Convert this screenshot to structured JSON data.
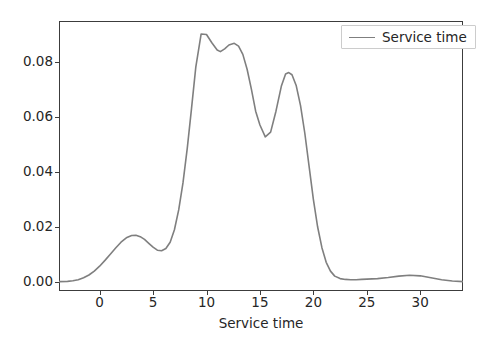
{
  "chart_data": {
    "type": "line",
    "title": "",
    "subtitle": "",
    "xlabel": "Service time",
    "ylabel": "",
    "xlim": [
      -3.8,
      34.0
    ],
    "ylim": [
      -0.0032,
      0.0947
    ],
    "grid": false,
    "legend_position": "upper right",
    "line_color": "#7f7f7f",
    "line_width": 1.6,
    "xticks": [
      0,
      5,
      10,
      15,
      20,
      25,
      30
    ],
    "xtick_labels": [
      "0",
      "5",
      "10",
      "15",
      "20",
      "25",
      "30"
    ],
    "yticks": [
      0.0,
      0.02,
      0.04,
      0.06,
      0.08
    ],
    "ytick_labels": [
      "0.00",
      "0.02",
      "0.04",
      "0.06",
      "0.08"
    ],
    "series": [
      {
        "name": "Service time",
        "x": [
          -3.8,
          -3.0,
          -2.5,
          -2.0,
          -1.5,
          -1.0,
          -0.5,
          0.0,
          0.5,
          1.0,
          1.5,
          2.0,
          2.5,
          3.0,
          3.4,
          3.8,
          4.2,
          4.6,
          5.0,
          5.4,
          5.8,
          6.2,
          6.6,
          7.0,
          7.4,
          7.8,
          8.2,
          8.6,
          9.0,
          9.5,
          10.0,
          10.5,
          11.0,
          11.3,
          11.7,
          12.1,
          12.6,
          13.0,
          13.4,
          13.8,
          14.2,
          14.6,
          15.0,
          15.5,
          16.0,
          16.5,
          17.0,
          17.4,
          17.7,
          18.0,
          18.4,
          18.8,
          19.2,
          19.6,
          20.0,
          20.4,
          20.8,
          21.2,
          21.6,
          22.0,
          22.5,
          23.0,
          23.5,
          24.0,
          24.5,
          25.0,
          26.0,
          27.0,
          28.0,
          29.0,
          30.0,
          31.0,
          32.0,
          33.0,
          34.0
        ],
        "y": [
          0.0002,
          0.0003,
          0.0005,
          0.0009,
          0.0016,
          0.0026,
          0.004,
          0.0058,
          0.0079,
          0.0101,
          0.0124,
          0.0145,
          0.0161,
          0.0169,
          0.017,
          0.0165,
          0.0155,
          0.0141,
          0.0127,
          0.0116,
          0.0114,
          0.0122,
          0.0145,
          0.019,
          0.0262,
          0.036,
          0.0485,
          0.063,
          0.078,
          0.09,
          0.0898,
          0.0868,
          0.0842,
          0.0836,
          0.0846,
          0.086,
          0.0866,
          0.0856,
          0.0826,
          0.0772,
          0.07,
          0.062,
          0.057,
          0.0527,
          0.0544,
          0.062,
          0.071,
          0.0755,
          0.076,
          0.0752,
          0.0712,
          0.064,
          0.054,
          0.042,
          0.03,
          0.02,
          0.0125,
          0.0072,
          0.004,
          0.0022,
          0.0013,
          0.001,
          0.0009,
          0.0009,
          0.001,
          0.0011,
          0.0013,
          0.0017,
          0.0022,
          0.0025,
          0.0023,
          0.0016,
          0.0009,
          0.0004,
          0.0002
        ],
        "peaks": [
          {
            "x": 3.4,
            "y": 0.017
          },
          {
            "x": 9.5,
            "y": 0.0905
          },
          {
            "x": 12.6,
            "y": 0.0866
          },
          {
            "x": 17.7,
            "y": 0.076
          },
          {
            "x": 29.0,
            "y": 0.0025
          }
        ],
        "valleys": [
          {
            "x": 5.5,
            "y": 0.0114
          },
          {
            "x": 11.3,
            "y": 0.0836
          },
          {
            "x": 15.5,
            "y": 0.0527
          }
        ]
      }
    ]
  },
  "legend": {
    "label": "Service time"
  },
  "axis": {
    "xlabel": "Service time"
  }
}
